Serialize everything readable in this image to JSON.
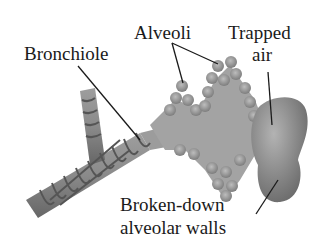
{
  "diagram": {
    "labels": {
      "alveoli": "Alveoli",
      "trapped_air_line1": "Trapped",
      "trapped_air_line2": "air",
      "bronchiole": "Bronchiole",
      "broken_walls_line1": "Broken-down",
      "broken_walls_line2": "alveolar walls"
    },
    "colors": {
      "tissue": "#9a9a9a",
      "tissue_dark": "#6e6e6e",
      "tissue_light": "#b8b8b8",
      "band": "#5a5a5a",
      "leader": "#1a1a1a"
    }
  }
}
